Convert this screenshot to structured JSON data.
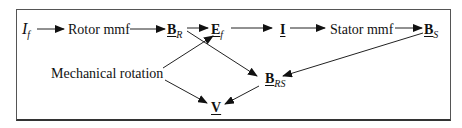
{
  "diagram": {
    "nodes": {
      "If": {
        "main": "I",
        "sub": "f"
      },
      "rotor_mmf": {
        "label": "Rotor mmf"
      },
      "BR": {
        "main": "B",
        "sub": "R"
      },
      "Ef": {
        "main": "E",
        "sub": "f"
      },
      "I": {
        "main": "I"
      },
      "stator_mmf": {
        "label": "Stator mmf"
      },
      "BS": {
        "main": "B",
        "sub": "S"
      },
      "mech_rotation": {
        "label": "Mechanical rotation"
      },
      "BRS": {
        "main": "B",
        "sub": "RS"
      },
      "V": {
        "main": "V"
      }
    },
    "edges": [
      {
        "from": "If",
        "to": "rotor_mmf"
      },
      {
        "from": "rotor_mmf",
        "to": "BR"
      },
      {
        "from": "BR",
        "to": "Ef"
      },
      {
        "from": "Ef",
        "to": "I"
      },
      {
        "from": "I",
        "to": "stator_mmf"
      },
      {
        "from": "stator_mmf",
        "to": "BS"
      },
      {
        "from": "BR",
        "to": "BRS"
      },
      {
        "from": "BS",
        "to": "BRS"
      },
      {
        "from": "mech_rotation",
        "to": "Ef"
      },
      {
        "from": "mech_rotation",
        "to": "V"
      },
      {
        "from": "BRS",
        "to": "V"
      }
    ]
  }
}
